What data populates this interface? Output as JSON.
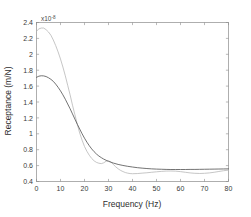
{
  "figure": {
    "background_color": "#ffffff",
    "frame_color": "#8c8c8c",
    "exponent_prefix": "x10",
    "exponent_power": "-8"
  },
  "chart_data": {
    "type": "line",
    "title": "",
    "subtitle": "",
    "xlabel": "Frequency (Hz)",
    "ylabel": "Receptance (m/N)",
    "y_exponent": "x10^-8",
    "xlim": [
      0,
      80
    ],
    "ylim": [
      0.4,
      2.4
    ],
    "grid": false,
    "legend_position": "none",
    "xticks": [
      0,
      10,
      20,
      30,
      40,
      50,
      60,
      70,
      80
    ],
    "xtick_labels": [
      "0",
      "10",
      "20",
      "30",
      "40",
      "50",
      "60",
      "70",
      "80"
    ],
    "yticks": [
      0.4,
      0.6,
      0.8,
      1,
      1.2,
      1.4,
      1.6,
      1.8,
      2,
      2.2,
      2.4
    ],
    "ytick_labels": [
      "0.4",
      "0.6",
      "0.8",
      "1",
      "1.2",
      "1.4",
      "1.6",
      "1.8",
      "2",
      "2.2",
      "2.4"
    ],
    "series": [
      {
        "name": "measured-receptance",
        "color": "#b8b8b8",
        "width": 0.8,
        "style": "solid",
        "x": [
          0,
          1,
          2,
          3,
          4,
          5,
          6,
          7,
          8,
          9,
          10,
          11,
          12,
          13,
          14,
          15,
          16,
          17,
          18,
          19,
          20,
          21,
          22,
          23,
          24,
          25,
          26,
          27,
          28,
          29,
          30,
          31,
          32,
          33,
          34,
          35,
          36,
          37,
          38,
          39,
          40,
          42,
          44,
          46,
          48,
          50,
          52,
          54,
          56,
          58,
          60,
          62,
          64,
          66,
          68,
          70,
          72,
          74,
          76,
          78,
          80
        ],
        "y": [
          2.29,
          2.32,
          2.33,
          2.33,
          2.31,
          2.28,
          2.24,
          2.18,
          2.11,
          2.03,
          1.94,
          1.84,
          1.73,
          1.61,
          1.49,
          1.36,
          1.24,
          1.12,
          1.01,
          0.92,
          0.84,
          0.78,
          0.73,
          0.69,
          0.66,
          0.64,
          0.63,
          0.625,
          0.635,
          0.655,
          0.66,
          0.645,
          0.615,
          0.585,
          0.56,
          0.54,
          0.525,
          0.513,
          0.505,
          0.5,
          0.498,
          0.5,
          0.505,
          0.51,
          0.516,
          0.522,
          0.527,
          0.531,
          0.532,
          0.53,
          0.524,
          0.516,
          0.508,
          0.503,
          0.501,
          0.503,
          0.508,
          0.516,
          0.526,
          0.536,
          0.543
        ]
      },
      {
        "name": "predicted-receptance",
        "color": "#5a5a5a",
        "width": 0.85,
        "style": "solid",
        "x": [
          0,
          1,
          2,
          3,
          4,
          5,
          6,
          7,
          8,
          9,
          10,
          11,
          12,
          13,
          14,
          15,
          16,
          17,
          18,
          19,
          20,
          21,
          22,
          23,
          24,
          25,
          26,
          27,
          28,
          29,
          30,
          32,
          34,
          36,
          38,
          40,
          42,
          44,
          46,
          48,
          50,
          52,
          54,
          56,
          58,
          60,
          62,
          64,
          66,
          68,
          70,
          72,
          74,
          76,
          78,
          80
        ],
        "y": [
          1.71,
          1.725,
          1.73,
          1.728,
          1.72,
          1.705,
          1.685,
          1.66,
          1.625,
          1.585,
          1.54,
          1.49,
          1.435,
          1.375,
          1.315,
          1.25,
          1.185,
          1.12,
          1.06,
          1.0,
          0.945,
          0.895,
          0.85,
          0.81,
          0.775,
          0.745,
          0.72,
          0.7,
          0.682,
          0.667,
          0.654,
          0.632,
          0.615,
          0.602,
          0.591,
          0.582,
          0.574,
          0.568,
          0.563,
          0.559,
          0.556,
          0.554,
          0.552,
          0.551,
          0.551,
          0.551,
          0.551,
          0.552,
          0.552,
          0.553,
          0.554,
          0.555,
          0.556,
          0.557,
          0.558,
          0.559
        ]
      }
    ]
  }
}
